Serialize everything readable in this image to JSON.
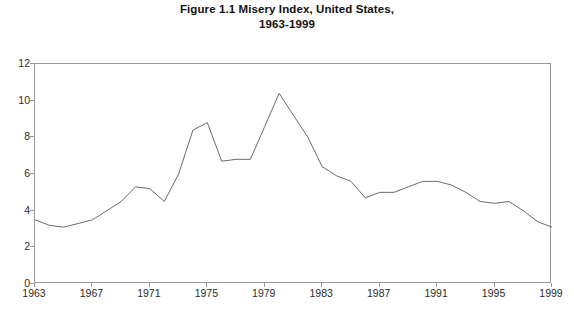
{
  "chart_data": {
    "type": "line",
    "title": "Figure 1.1 Misery Index, United States, 1963-1999",
    "title_lines": [
      "Figure 1.1 Misery Index, United States,",
      "1963-1999"
    ],
    "xlabel": "",
    "ylabel": "",
    "xlim": [
      1963,
      1999
    ],
    "ylim": [
      0,
      12
    ],
    "ytick_values": [
      0,
      2,
      4,
      6,
      8,
      10,
      12
    ],
    "ytick_labels": [
      "0",
      "2",
      "4",
      "6",
      "8",
      "10",
      "12"
    ],
    "xtick_values": [
      1963,
      1967,
      1971,
      1975,
      1979,
      1983,
      1987,
      1991,
      1995,
      1999
    ],
    "xtick_labels": [
      "1963",
      "1967",
      "1971",
      "1975",
      "1979",
      "1983",
      "1987",
      "1991",
      "1995",
      "1999"
    ],
    "grid": false,
    "legend": false,
    "legend_position": "none",
    "line_color": "#6b6b6b",
    "line_width": 1,
    "markers": false,
    "x": [
      1963,
      1964,
      1965,
      1966,
      1967,
      1968,
      1969,
      1970,
      1971,
      1972,
      1973,
      1974,
      1975,
      1976,
      1977,
      1978,
      1979,
      1980,
      1981,
      1982,
      1983,
      1984,
      1985,
      1986,
      1987,
      1988,
      1989,
      1990,
      1991,
      1992,
      1993,
      1994,
      1995,
      1996,
      1997,
      1998,
      1999
    ],
    "values": [
      3.5,
      3.2,
      3.1,
      3.3,
      3.5,
      4.0,
      4.5,
      5.3,
      5.2,
      4.5,
      6.0,
      8.4,
      8.8,
      6.7,
      6.8,
      6.8,
      8.6,
      10.4,
      9.2,
      8.0,
      6.4,
      5.9,
      5.6,
      4.7,
      5.0,
      5.0,
      5.3,
      5.6,
      5.6,
      5.4,
      5.0,
      4.5,
      4.4,
      4.5,
      4.0,
      3.4,
      3.1
    ],
    "series": [
      {
        "name": "Misery Index",
        "values": [
          3.5,
          3.2,
          3.1,
          3.3,
          3.5,
          4.0,
          4.5,
          5.3,
          5.2,
          4.5,
          6.0,
          8.4,
          8.8,
          6.7,
          6.8,
          6.8,
          8.6,
          10.4,
          9.2,
          8.0,
          6.4,
          5.9,
          5.6,
          4.7,
          5.0,
          5.0,
          5.3,
          5.6,
          5.6,
          5.4,
          5.0,
          4.5,
          4.4,
          4.5,
          4.0,
          3.4,
          3.1
        ]
      }
    ],
    "annotations": []
  }
}
